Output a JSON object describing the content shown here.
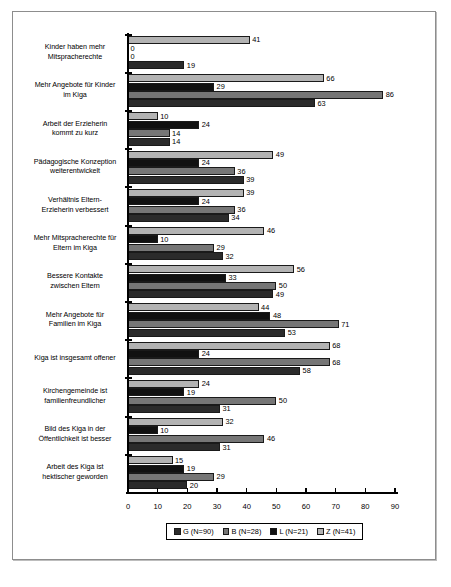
{
  "chart_data": {
    "type": "bar",
    "orientation": "horizontal",
    "title": "",
    "xlabel": "",
    "ylabel": "",
    "xlim": [
      0,
      90
    ],
    "xticks": [
      0,
      10,
      20,
      30,
      40,
      50,
      60,
      70,
      80,
      90
    ],
    "grid": false,
    "legend_position": "bottom",
    "categories": [
      "Kinder haben mehr Mitspracherechte",
      "Mehr Angebote für Kinder im Kiga",
      "Arbeit der Erzieherin kommt zu kurz",
      "Pädagogische Konzeption weiterentwickelt",
      "Verhältnis Eltern-Erzieherin verbessert",
      "Mehr Mitspracherechte für Eltern im Kiga",
      "Bessere Kontakte zwischen Eltern",
      "Mehr Angebote für Familien im Kiga",
      "Kiga ist insgesamt offener",
      "Kirchengemeinde ist familienfreundlicher",
      "Bild des Kiga in der Öffentlichkeit ist besser",
      "Arbeit des Kiga ist hektischer geworden"
    ],
    "category_lines": [
      [
        "Kinder haben mehr",
        "Mitspracherechte"
      ],
      [
        "Mehr Angebote für Kinder",
        "im Kiga"
      ],
      [
        "Arbeit der Erzieherin",
        "kommt zu kurz"
      ],
      [
        "Pädagogische Konzeption",
        "weiterentwickelt"
      ],
      [
        "Verhältnis Eltern-",
        "Erzieherin verbessert"
      ],
      [
        "Mehr Mitspracherechte für",
        "Eltern im Kiga"
      ],
      [
        "Bessere Kontakte",
        "zwischen Eltern"
      ],
      [
        "Mehr Angebote für",
        "Familien im Kiga"
      ],
      [
        "Kiga ist insgesamt offener",
        ""
      ],
      [
        "Kirchengemeinde ist",
        "familienfreundlicher"
      ],
      [
        "Bild des Kiga in der",
        "Öffentlichkeit ist besser"
      ],
      [
        "Arbeit des Kiga ist",
        "hektischer geworden"
      ]
    ],
    "series": [
      {
        "name": "Z (N=41)",
        "key": "Z",
        "color": "#b3b3b3",
        "values": [
          41,
          66,
          10,
          49,
          39,
          46,
          56,
          44,
          68,
          24,
          32,
          15
        ]
      },
      {
        "name": "L (N=21)",
        "key": "L",
        "color": "#111111",
        "values": [
          0,
          29,
          24,
          24,
          24,
          10,
          33,
          48,
          24,
          19,
          10,
          19
        ]
      },
      {
        "name": "B (N=28)",
        "key": "B",
        "color": "#767676",
        "values": [
          0,
          86,
          14,
          36,
          36,
          29,
          50,
          71,
          68,
          50,
          46,
          29
        ]
      },
      {
        "name": "G (N=90)",
        "key": "G",
        "color": "#2b2b2b",
        "values": [
          19,
          63,
          14,
          39,
          34,
          32,
          49,
          53,
          58,
          31,
          31,
          20
        ]
      }
    ],
    "bar_draw_order": [
      "Z",
      "L",
      "B",
      "G"
    ],
    "legend_order": [
      "G (N=90)",
      "B (N=28)",
      "L (N=21)",
      "Z (N=41)"
    ],
    "legend_entries": [
      {
        "label": "G (N=90)",
        "color": "#2b2b2b"
      },
      {
        "label": "B (N=28)",
        "color": "#767676"
      },
      {
        "label": "L (N=21)",
        "color": "#111111"
      },
      {
        "label": "Z (N=41)",
        "color": "#b3b3b3"
      }
    ]
  }
}
